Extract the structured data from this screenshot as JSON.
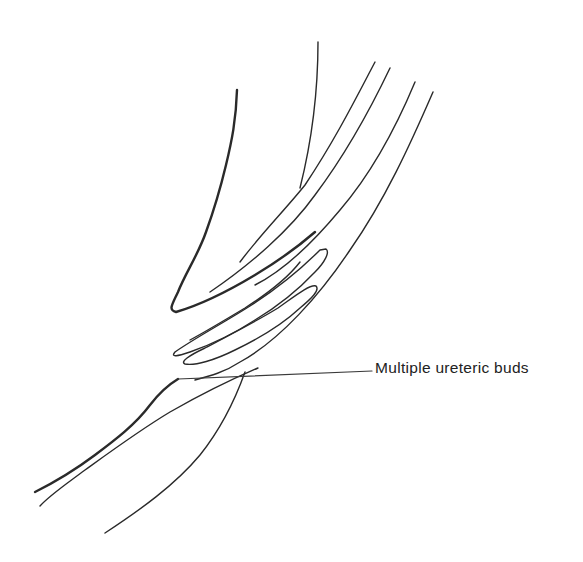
{
  "figure": {
    "type": "anatomical-line-drawing",
    "stroke_color": "#2a2a2a",
    "background": "#ffffff",
    "annotation": {
      "label": "Multiple ureteric buds",
      "leader_from": [
        178,
        379
      ],
      "leader_to": [
        372,
        371
      ]
    },
    "paths": [
      {
        "name": "left-wall-outline",
        "weight": "thick",
        "d": "M237 90 C236 120 232 140 226 165 C220 190 214 210 206 232 C198 255 186 272 178 292 C172 305 168 310 176 312 C200 305 230 290 255 275 C280 260 300 245 315 232"
      },
      {
        "name": "central-septum-line",
        "weight": "thin",
        "d": "M318 42 C318 90 312 140 300 188"
      },
      {
        "name": "inner-tube-line-1",
        "weight": "thin",
        "d": "M375 62 C355 100 335 140 305 185 C285 210 260 235 240 262"
      },
      {
        "name": "inner-tube-line-2",
        "weight": "thin",
        "d": "M390 68 C370 110 345 155 315 195 C290 230 250 265 210 292"
      },
      {
        "name": "outer-tube-line-1",
        "weight": "thin",
        "d": "M415 82 C395 130 370 175 340 210 C315 240 285 270 255 285"
      },
      {
        "name": "outer-tube-line-2",
        "weight": "thin",
        "d": "M433 92 C410 145 385 200 350 250 C320 295 280 340 240 362 C225 372 210 376 195 380"
      },
      {
        "name": "ureteric-bud-1",
        "weight": "thin",
        "d": "M326 249 C330 252 325 262 315 272 C300 288 280 305 255 320 C235 333 210 345 190 352 C178 356 170 358 175 352 C195 338 225 322 250 306 C275 290 300 270 320 250 Z"
      },
      {
        "name": "ureteric-bud-2",
        "weight": "thin",
        "d": "M316 286 C320 290 312 298 300 308 C285 322 260 338 235 350 C215 360 195 366 185 364 C180 362 188 356 205 348 C228 336 255 322 278 308 C295 296 310 284 316 286 Z"
      },
      {
        "name": "ureteric-bud-3",
        "weight": "thin",
        "d": "M300 262 C290 275 270 292 245 308 C225 320 205 332 190 340"
      },
      {
        "name": "lower-left-thick-outline",
        "weight": "thick",
        "d": "M178 379 C168 385 160 392 150 405 C135 425 115 440 95 455 C75 470 55 482 35 492"
      },
      {
        "name": "lower-middle-line",
        "weight": "thin",
        "d": "M258 368 C230 380 200 395 170 412 C140 430 110 452 85 470 C65 485 50 495 40 506"
      },
      {
        "name": "lower-right-curve",
        "weight": "thin",
        "d": "M245 372 C235 400 220 430 200 455 C175 485 140 510 105 533"
      }
    ]
  }
}
